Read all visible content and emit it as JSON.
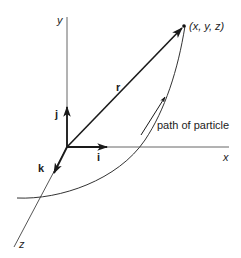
{
  "diagram": {
    "type": "3d-position-vector",
    "axes": {
      "x_label": "x",
      "y_label": "y",
      "z_label": "z"
    },
    "unit_vectors": {
      "i_label": "i",
      "j_label": "j",
      "k_label": "k"
    },
    "position_vector_label": "r",
    "point_label": "(x, y, z)",
    "path_label": "path of particle",
    "colors": {
      "line": "#222222",
      "axis": "#555555",
      "background": "#ffffff"
    }
  }
}
